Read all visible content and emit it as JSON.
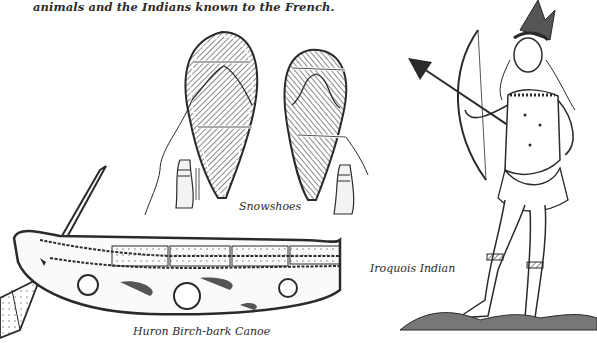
{
  "page": {
    "intro_text": "animals and the Indians known to the French.",
    "captions": {
      "snowshoes": "Snowshoes",
      "canoe": "Huron Birch-bark Canoe",
      "iroquois": "Iroquois Indian"
    }
  },
  "illustrations": [
    {
      "name": "snowshoes",
      "count": 2,
      "with_moccasins": 2
    },
    {
      "name": "huron-birch-bark-canoe",
      "with_paddle": true
    },
    {
      "name": "iroquois-indian",
      "holding": "bow and arrow"
    }
  ],
  "colors": {
    "ink": "#2a2a2a",
    "paper": "#ffffff",
    "fill_gray": "#8a8a8a"
  }
}
